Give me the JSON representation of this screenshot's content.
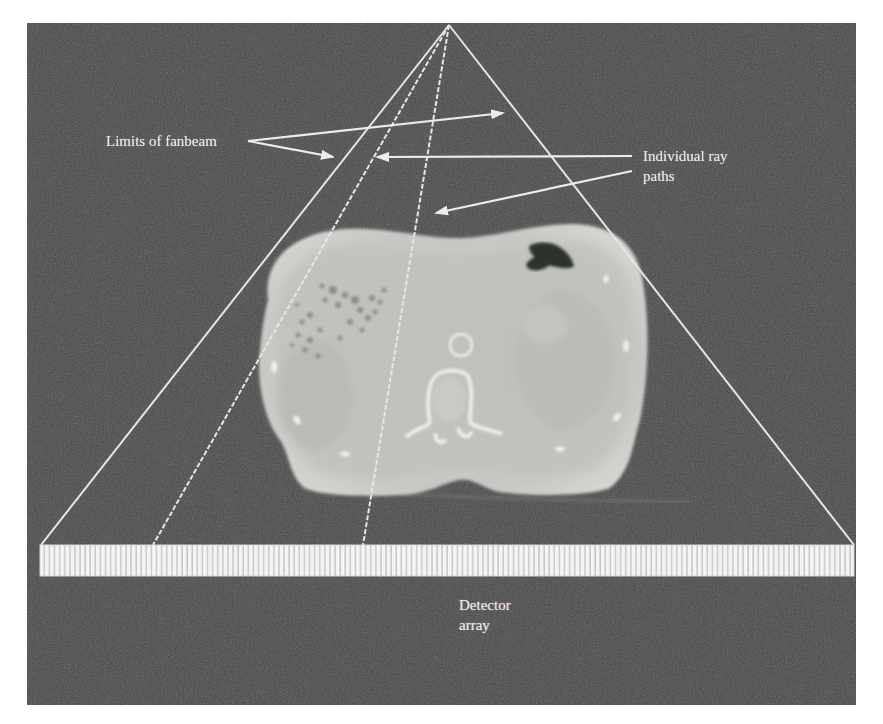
{
  "figure": {
    "panel": {
      "x": 27,
      "y": 23,
      "width": 829,
      "height": 682,
      "background": "#4a4a4a"
    },
    "apex": {
      "x": 449,
      "y": 25
    },
    "fan_limits": [
      {
        "name": "left-fan-limit",
        "x2": 41,
        "y2": 545
      },
      {
        "name": "right-fan-limit",
        "x2": 854,
        "y2": 545
      }
    ],
    "ray_paths": [
      {
        "name": "ray-path-1",
        "x2": 153,
        "y2": 545
      },
      {
        "name": "ray-path-2",
        "x2": 363,
        "y2": 545
      }
    ],
    "detector_array": {
      "x": 40,
      "y": 545,
      "width": 814,
      "height": 31,
      "element_count": 160
    }
  },
  "labels": {
    "fanbeam": "Limits of fanbeam",
    "rays_line1": "Individual ray",
    "rays_line2": "paths",
    "detector_line1": "Detector",
    "detector_line2": "array"
  },
  "annotations": {
    "fanbeam_arrows": [
      {
        "from": [
          248,
          141
        ],
        "to": [
          503,
          113
        ]
      },
      {
        "from": [
          248,
          141
        ],
        "to": [
          333,
          157
        ]
      }
    ],
    "ray_arrows": [
      {
        "from": [
          632,
          156
        ],
        "to": [
          377,
          157
        ]
      },
      {
        "from": [
          632,
          171
        ],
        "to": [
          436,
          213
        ]
      }
    ]
  },
  "colors": {
    "background_panel": "#4a4a4a",
    "line": "#e8e8e8",
    "ct_body": "#c9cbc6",
    "ct_body_edge": "#d6d8d3",
    "bone": "#f2f2f2",
    "gas": "#2a2a2a"
  }
}
